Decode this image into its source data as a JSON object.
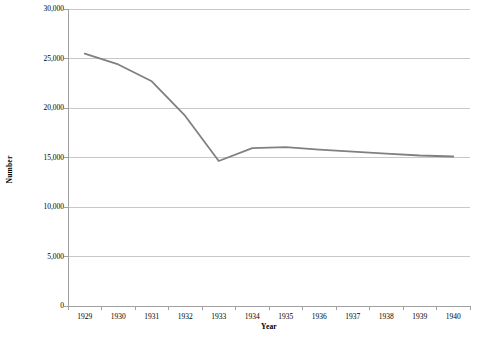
{
  "chart_data": {
    "type": "line",
    "title": "",
    "xlabel": "Year",
    "ylabel": "Number",
    "categories": [
      "1929",
      "1930",
      "1931",
      "1932",
      "1933",
      "1934",
      "1935",
      "1936",
      "1937",
      "1938",
      "1939",
      "1940"
    ],
    "x": [
      1929,
      1930,
      1931,
      1932,
      1933,
      1934,
      1935,
      1936,
      1937,
      1938,
      1939,
      1940
    ],
    "values": [
      25500,
      24400,
      22700,
      19200,
      14650,
      15950,
      16050,
      15800,
      15600,
      15400,
      15200,
      15100
    ],
    "series": [
      {
        "name": "Number",
        "color": "#808080",
        "values": [
          25500,
          24400,
          22700,
          19200,
          14650,
          15950,
          16050,
          15800,
          15600,
          15400,
          15200,
          15100
        ]
      }
    ],
    "ylim": [
      0,
      30000
    ],
    "ytick_values": [
      0,
      5000,
      10000,
      15000,
      20000,
      25000,
      30000
    ],
    "ytick_labels": [
      "0",
      "5,000",
      "10,000",
      "15,000",
      "20,000",
      "25,000",
      "30,000"
    ],
    "xtick_labels": [
      "1929",
      "1930",
      "1931",
      "1932",
      "1933",
      "1934",
      "1935",
      "1936",
      "1937",
      "1938",
      "1939",
      "1940"
    ],
    "grid": "horizontal",
    "legend": "none",
    "gridline_color": "#c8c8c8",
    "axis_color": "#a0a0a0",
    "background": "#ffffff"
  }
}
